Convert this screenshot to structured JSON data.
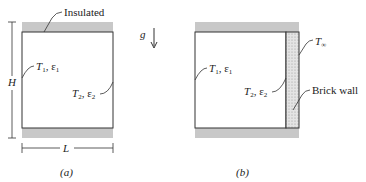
{
  "figure_a": {
    "caption": "(a)",
    "insulated_label": "Insulated",
    "left_wall": {
      "T": "T",
      "T_sub": "1",
      "eps": "ε",
      "eps_sub": "1"
    },
    "right_wall": {
      "T": "T",
      "T_sub": "2",
      "eps": "ε",
      "eps_sub": "2"
    },
    "height_label": "H",
    "width_label": "L"
  },
  "gravity_label": "g",
  "figure_b": {
    "caption": "(b)",
    "left_wall": {
      "T": "T",
      "T_sub": "1",
      "eps": "ε",
      "eps_sub": "1"
    },
    "right_wall": {
      "T": "T",
      "T_sub": "2",
      "eps": "ε",
      "eps_sub": "2"
    },
    "ambient": {
      "T": "T",
      "T_sub": "∞"
    },
    "brick_label": "Brick wall"
  },
  "colors": {
    "insulation": "#c8c8c8",
    "line": "#333333",
    "brick": "#d9d9d9"
  }
}
